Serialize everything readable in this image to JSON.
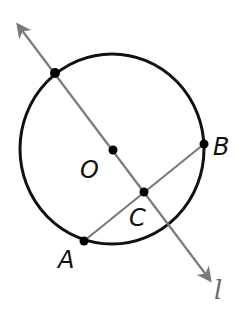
{
  "diagram": {
    "title": "",
    "colors": {
      "circle": "#111111",
      "line": "#7a7a7a",
      "point": "#000000",
      "label": "#111111",
      "line_label": "#6b6b6b"
    },
    "circle": {
      "center_label": "O",
      "cx": 112,
      "cy": 149,
      "rx": 92,
      "ry": 95
    },
    "line_l": {
      "label": "l",
      "from": [
        18,
        25
      ],
      "to": [
        210,
        280
      ]
    },
    "chord_AB": {
      "from_label": "A",
      "to_label": "B"
    },
    "points": [
      {
        "name": "top-intersection",
        "label": "",
        "x": 55,
        "y": 73
      },
      {
        "name": "O",
        "label": "O",
        "x": 113,
        "y": 150
      },
      {
        "name": "C",
        "label": "C",
        "x": 144,
        "y": 192
      },
      {
        "name": "B",
        "label": "B",
        "x": 204,
        "y": 144
      },
      {
        "name": "A",
        "label": "A",
        "x": 84,
        "y": 241
      }
    ],
    "labels": {
      "O": "O",
      "C": "C",
      "B": "B",
      "A": "A",
      "l": "l"
    }
  }
}
